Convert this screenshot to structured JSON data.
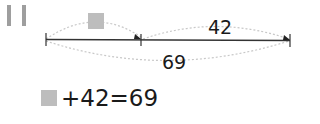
{
  "problem": {
    "number_label": "11"
  },
  "diagram": {
    "unknown_placeholder": "unknown-box",
    "segment_label": "42",
    "total_label": "69",
    "colors": {
      "line": "#333333",
      "dotted_arc": "#c8c8c8",
      "unknown_box": "#bdbdbd"
    }
  },
  "equation": {
    "plus": "+",
    "addend": "42",
    "equals": "=",
    "result": "69"
  }
}
